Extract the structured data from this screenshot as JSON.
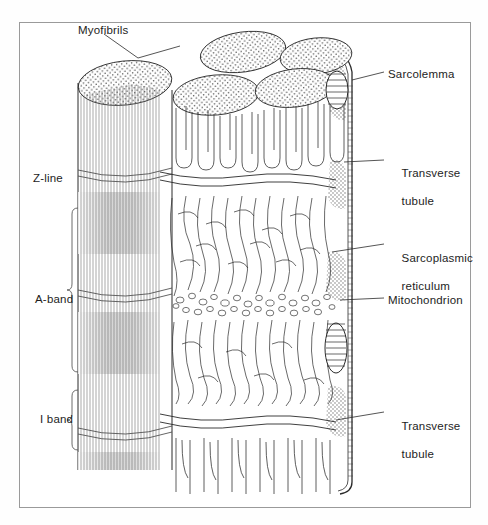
{
  "figure": {
    "title_visible": false,
    "frame": {
      "x": 19,
      "y": 22,
      "width": 452,
      "height": 486,
      "border_color": "#9a9a9a"
    },
    "palette": {
      "ink": "#1d1d1d",
      "line": "#3a3a3a",
      "light_line": "#7d7d7d",
      "stipple": "#555555",
      "paper": "#ffffff",
      "shade": "#cfcfcf"
    }
  },
  "labels": {
    "left": [
      {
        "id": "myofibrils",
        "text": "Myofibrils",
        "x": 78,
        "y": 24,
        "leader": true,
        "bracket": false
      },
      {
        "id": "z-line",
        "text": "Z-line",
        "x": 33,
        "y": 172,
        "leader": false,
        "bracket": false
      },
      {
        "id": "a-band",
        "text": "A-band",
        "x": 35,
        "y": 293,
        "leader": false,
        "bracket": true
      },
      {
        "id": "i-band",
        "text": "I band",
        "x": 40,
        "y": 413,
        "leader": false,
        "bracket": true
      }
    ],
    "right": [
      {
        "id": "sarcolemma",
        "text": "Sarcolemma",
        "line2": "",
        "x": 388,
        "y": 68,
        "leader": true
      },
      {
        "id": "transverse-tubule-upper",
        "text": "Transverse",
        "line2": "tubule",
        "x": 388,
        "y": 152,
        "leader": true
      },
      {
        "id": "sarcoplasmic-reticulum",
        "text": "Sarcoplasmic",
        "line2": "reticulum",
        "x": 388,
        "y": 237,
        "leader": true
      },
      {
        "id": "mitochondrion",
        "text": "Mitochondrion",
        "line2": "",
        "x": 388,
        "y": 294,
        "leader": true
      },
      {
        "id": "transverse-tubule-lower",
        "text": "Transverse",
        "line2": "tubule",
        "x": 388,
        "y": 405,
        "leader": true
      }
    ]
  },
  "structures": {
    "myofibril_tops": 6,
    "myofibril_column_striations": 30,
    "z_lines": [
      175,
      258,
      300,
      395,
      432
    ],
    "sarcoplasmic_reticulum_tubules": 24,
    "terminal_cisternae_vesicles": 38,
    "mitochondria_count": 2,
    "sarcolemma_side": "right"
  }
}
